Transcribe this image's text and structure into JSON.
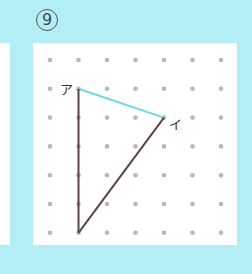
{
  "problem_number": "9",
  "labels": {
    "a": "ア",
    "i": "イ"
  },
  "grid": {
    "cols": 7,
    "rows": 7,
    "x0": 50,
    "y0": 60,
    "dx": 28.5,
    "dy": 28.8,
    "dot_color": "#b8b8b8"
  },
  "points": {
    "a": [
      1,
      1
    ],
    "i": [
      4,
      2
    ],
    "bottom": [
      1,
      6
    ]
  },
  "colors": {
    "background": "#b3eef4",
    "panel": "#ffffff",
    "line_brown": "#5a4540",
    "line_cyan": "#6fd9e0"
  }
}
